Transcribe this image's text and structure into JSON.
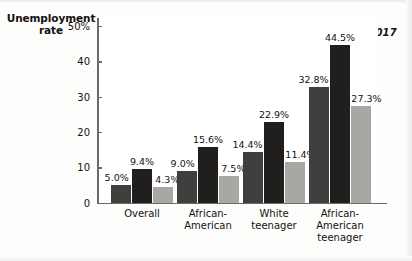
{
  "chart_data": {
    "type": "bar",
    "title": "",
    "ylabel": "Unemployment rate",
    "xlabel": "",
    "ylim": [
      0,
      50
    ],
    "yticks": [
      0,
      10,
      20,
      30,
      40,
      50
    ],
    "ytick_labels": [
      "0",
      "10",
      "20",
      "30",
      "40",
      "50%"
    ],
    "grid": false,
    "legend_position": "top-right",
    "categories": [
      "Overall",
      "African-\nAmerican",
      "White\nteenager",
      "African-\nAmerican\nteenager"
    ],
    "series": [
      {
        "name": "2007",
        "color": "#413f3d",
        "values": [
          5.0,
          9.0,
          14.4,
          32.8
        ],
        "labels": [
          "5.0%",
          "9.0%",
          "14.4%",
          "32.8%"
        ]
      },
      {
        "name": "2010",
        "color": "#211f1e",
        "values": [
          9.4,
          15.6,
          22.9,
          44.5
        ],
        "labels": [
          "9.4%",
          "15.6%",
          "22.9%",
          "44.5%"
        ]
      },
      {
        "name": "2017",
        "color": "#a9a7a3",
        "values": [
          4.3,
          7.5,
          11.4,
          27.3
        ],
        "labels": [
          "4.3%",
          "7.5%",
          "11.4%",
          "27.3%"
        ]
      }
    ]
  },
  "axis_title": {
    "line1": "Unemployment",
    "line2": "rate"
  },
  "legend": {
    "items": [
      {
        "label": "2007",
        "color": "#413f3d"
      },
      {
        "label": "2010",
        "color": "#211f1e"
      },
      {
        "label": "2017",
        "color": "#a9a7a3"
      }
    ]
  }
}
